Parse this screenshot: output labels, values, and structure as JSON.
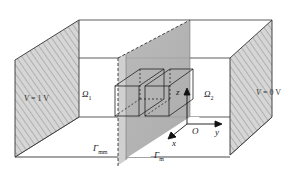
{
  "figure": {
    "type": "3D schematic of electrochemical cell with membrane",
    "left_electrode": {
      "label_var": "V",
      "label_eq": " = 1 V",
      "hatched": true
    },
    "right_electrode": {
      "label_var": "V",
      "label_eq": " = 0 V",
      "hatched": true
    },
    "domains": [
      {
        "id": "omega1",
        "symbol": "Ω",
        "subscript": "1"
      },
      {
        "id": "omega2",
        "symbol": "Ω",
        "subscript": "2"
      }
    ],
    "boundaries": [
      {
        "id": "gamma_mm",
        "symbol": "Γ",
        "subscript": "mm"
      },
      {
        "id": "gamma_m",
        "symbol": "Γ",
        "subscript": "m"
      }
    ],
    "axes": {
      "origin": "O",
      "x": "x",
      "y": "y",
      "z": "z"
    },
    "colors": {
      "line": "#333333",
      "membrane": "#a9a9a9",
      "membrane_light": "#cfcfcf",
      "hatch_bg": "#d9d9d9",
      "hatch_line": "#8a8a8a"
    }
  }
}
